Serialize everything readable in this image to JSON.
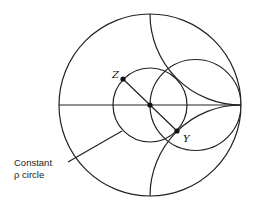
{
  "diagram": {
    "type": "smith-chart",
    "points": {
      "z_label": "Z",
      "y_label": "Y"
    },
    "annotation": {
      "line1": "Constant",
      "line2": "ρ circle"
    },
    "colors": {
      "stroke": "#222222",
      "background": "#ffffff"
    }
  }
}
